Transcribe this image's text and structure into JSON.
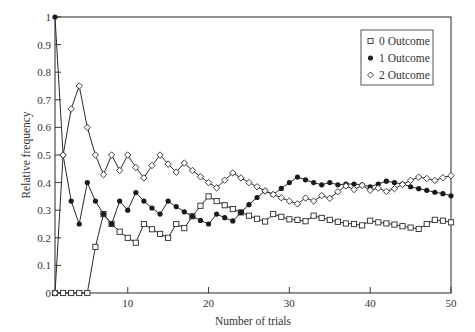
{
  "chart_data": {
    "type": "line",
    "title": "",
    "xlabel": "Number of trials",
    "ylabel": "Relative frequency",
    "xlim": [
      1,
      50
    ],
    "ylim": [
      0,
      1
    ],
    "x_ticks": [
      10,
      20,
      30,
      40,
      50
    ],
    "y_ticks": [
      0,
      0.1,
      0.2,
      0.3,
      0.4,
      0.5,
      0.6,
      0.7,
      0.8,
      0.9,
      1
    ],
    "y_tick_labels": [
      "0",
      "0.1",
      "0.2",
      "0.3",
      "0.4",
      "0.5",
      "0.6",
      "0.7",
      "0.8",
      "0.9",
      "1"
    ],
    "grid": false,
    "legend_position": "upper right",
    "x": [
      1,
      2,
      3,
      4,
      5,
      6,
      7,
      8,
      9,
      10,
      11,
      12,
      13,
      14,
      15,
      16,
      17,
      18,
      19,
      20,
      21,
      22,
      23,
      24,
      25,
      26,
      27,
      28,
      29,
      30,
      31,
      32,
      33,
      34,
      35,
      36,
      37,
      38,
      39,
      40,
      41,
      42,
      43,
      44,
      45,
      46,
      47,
      48,
      49,
      50
    ],
    "series": [
      {
        "name": "0 Outcome",
        "marker": "open-square",
        "values": [
          0,
          0,
          0,
          0,
          0,
          0.167,
          0.286,
          0.25,
          0.222,
          0.2,
          0.182,
          0.25,
          0.231,
          0.214,
          0.2,
          0.25,
          0.235,
          0.278,
          0.316,
          0.35,
          0.333,
          0.318,
          0.304,
          0.292,
          0.28,
          0.269,
          0.259,
          0.286,
          0.276,
          0.267,
          0.265,
          0.26,
          0.28,
          0.272,
          0.265,
          0.258,
          0.252,
          0.25,
          0.245,
          0.262,
          0.256,
          0.252,
          0.248,
          0.242,
          0.237,
          0.232,
          0.25,
          0.265,
          0.262,
          0.256
        ]
      },
      {
        "name": "1 Outcome",
        "marker": "filled-circle",
        "values": [
          1,
          0.5,
          0.333,
          0.25,
          0.4,
          0.333,
          0.286,
          0.25,
          0.333,
          0.3,
          0.364,
          0.333,
          0.308,
          0.286,
          0.333,
          0.313,
          0.294,
          0.278,
          0.263,
          0.25,
          0.286,
          0.273,
          0.261,
          0.292,
          0.32,
          0.346,
          0.37,
          0.357,
          0.379,
          0.4,
          0.42,
          0.41,
          0.4,
          0.392,
          0.4,
          0.392,
          0.395,
          0.395,
          0.392,
          0.385,
          0.395,
          0.405,
          0.4,
          0.395,
          0.385,
          0.378,
          0.372,
          0.365,
          0.36,
          0.352
        ]
      },
      {
        "name": "2 Outcome",
        "marker": "open-diamond",
        "values": [
          0,
          0.5,
          0.667,
          0.75,
          0.6,
          0.5,
          0.429,
          0.5,
          0.444,
          0.5,
          0.455,
          0.417,
          0.462,
          0.5,
          0.467,
          0.438,
          0.471,
          0.444,
          0.421,
          0.4,
          0.381,
          0.409,
          0.435,
          0.417,
          0.4,
          0.385,
          0.37,
          0.357,
          0.345,
          0.333,
          0.323,
          0.344,
          0.333,
          0.353,
          0.343,
          0.367,
          0.388,
          0.375,
          0.39,
          0.372,
          0.38,
          0.368,
          0.378,
          0.393,
          0.408,
          0.42,
          0.415,
          0.408,
          0.418,
          0.425
        ]
      }
    ]
  },
  "legend": {
    "items": [
      {
        "label": "0 Outcome",
        "marker": "open-square"
      },
      {
        "label": "1 Outcome",
        "marker": "filled-circle"
      },
      {
        "label": "2 Outcome",
        "marker": "open-diamond"
      }
    ]
  },
  "colors": {
    "line": "#2a2a2a",
    "axis": "#3a3a3a",
    "background": "#ffffff"
  }
}
